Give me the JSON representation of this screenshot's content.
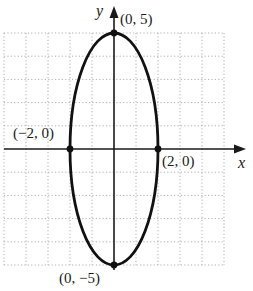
{
  "chart_data": {
    "type": "line",
    "title": "",
    "xlabel": "x",
    "ylabel": "y",
    "xlim": [
      -5,
      5
    ],
    "ylim": [
      -5,
      5
    ],
    "grid": true,
    "curve": {
      "kind": "ellipse",
      "center": [
        0,
        0
      ],
      "semi_axis_x": 2,
      "semi_axis_y": 5,
      "equation": "x^2/4 + y^2/25 = 1"
    },
    "points": [
      {
        "x": 0,
        "y": 5,
        "label": "(0, 5)"
      },
      {
        "x": 0,
        "y": -5,
        "label": "(0, −5)"
      },
      {
        "x": -2,
        "y": 0,
        "label": "(−2, 0)"
      },
      {
        "x": 2,
        "y": 0,
        "label": "(2, 0)"
      }
    ]
  },
  "labels": {
    "x_axis": "x",
    "y_axis": "y",
    "top_vertex": "(0, 5)",
    "bottom_vertex": "(0, −5)",
    "left_covertex": "(−2, 0)",
    "right_covertex": "(2, 0)"
  },
  "colors": {
    "curve": "#111111",
    "axis": "#1a1a1a",
    "grid": "#9a9a9a"
  }
}
